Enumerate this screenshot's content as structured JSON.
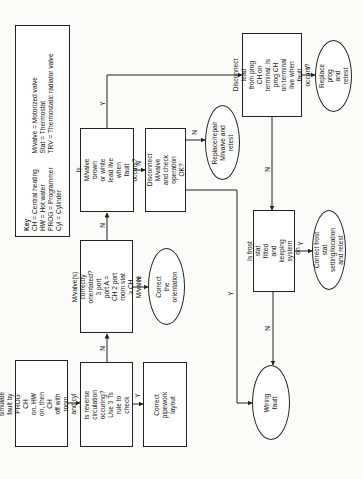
{
  "key": {
    "title": "Key",
    "col1": "CH = Central heating\nHW = Hot water\nPROG = Programmer\nCyl = Cylinder",
    "col2": "M/valve = Motorized valve\nStat = Thermostat\nTRV = Thermostatic radiator valve"
  },
  "nodes": {
    "start": "Attempt to simulate\nfault by PROG CH\non, HW on, then CH\noff with room and cyl\nstats calling for heat",
    "reverse": "Is reverse circulation\noccuring? Use 3 Ts\nrule to check",
    "pipework": "Correct pipework\nlayout",
    "orient_q": "M/valve(s) correctly\norientated? 3 port\nport A = CH 2 port\nroom stat > CH M/valve",
    "orient_fix": "Correct the\norientation",
    "brown": "Is M/valve brown\nor white lead live\nwhen fault occurs?",
    "disconnect_mv": "Disconnect M/valve\nand check\noperation OK?",
    "replace_mv": "Replace/repair\nM/valve and\nretest",
    "disconnect_lead": "Disconnect lead\nfrom prog CH on\nterminal. Is prog CH\non terminal live when\nfault occurs?",
    "replace_prog": "Replace prog\nand retest",
    "frost_q": "Is frost stat fitted\nand keeping\nsystem on",
    "frost_fix": "Correct frost stat\nsetting/location\nand retest",
    "wiring": "Wiring fault"
  },
  "labels": {
    "yes": "Y",
    "no": "N"
  }
}
